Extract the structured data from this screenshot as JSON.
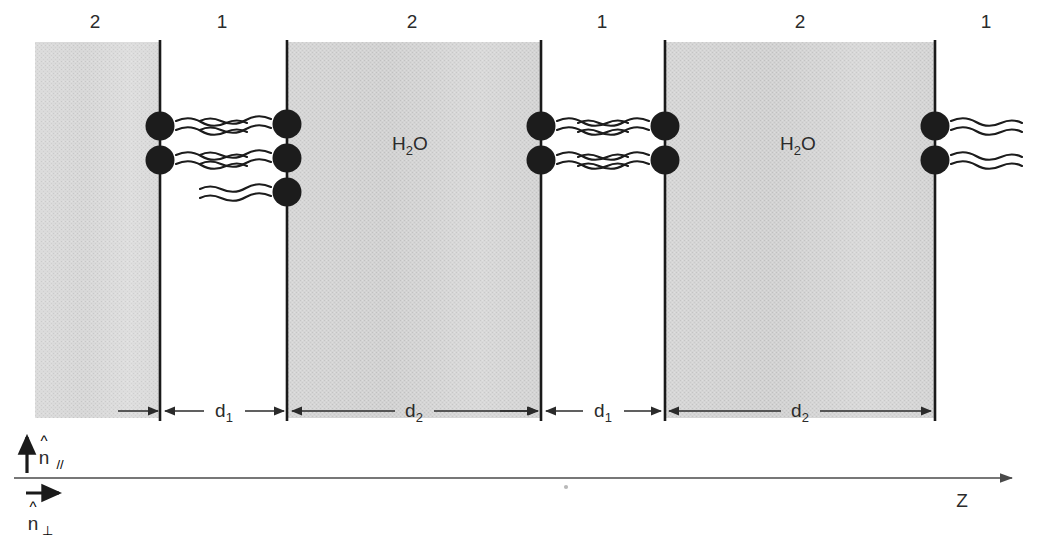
{
  "figure": {
    "background_color": "#ffffff",
    "ink_color": "#1c1c1c",
    "slab_fill_color": "#cfcfcf",
    "slab_fill_color_light": "#d6d6d6"
  },
  "top_labels": [
    {
      "text": "2",
      "x": 95
    },
    {
      "text": "1",
      "x": 222
    },
    {
      "text": "2",
      "x": 412
    },
    {
      "text": "1",
      "x": 602
    },
    {
      "text": "2",
      "x": 800
    },
    {
      "text": "1",
      "x": 986
    }
  ],
  "phase_labels": [
    {
      "text_main": "H",
      "text_sub": "2",
      "text_tail": "O",
      "x": 395,
      "y": 145
    },
    {
      "text_main": "H",
      "text_sub": "2",
      "text_tail": "O",
      "x": 783,
      "y": 145
    }
  ],
  "slabs": [
    {
      "name": "slab-medium-2-left-edge",
      "x": 35,
      "width": 126,
      "shade": "light"
    },
    {
      "name": "slab-medium-2-water-first",
      "x": 288,
      "width": 253,
      "shade": "normal"
    },
    {
      "name": "slab-medium-2-water-second",
      "x": 665,
      "width": 271,
      "shade": "normal"
    }
  ],
  "membrane_lines": [
    {
      "name": "membrane-interface-1",
      "x": 160
    },
    {
      "name": "membrane-interface-2",
      "x": 287
    },
    {
      "name": "membrane-interface-3",
      "x": 541
    },
    {
      "name": "membrane-interface-4",
      "x": 665
    },
    {
      "name": "membrane-interface-5",
      "x": 935
    }
  ],
  "lipids": [
    {
      "interface": 1,
      "x": 160,
      "y": 126,
      "tail_direction": "right"
    },
    {
      "interface": 1,
      "x": 160,
      "y": 160,
      "tail_direction": "right"
    },
    {
      "interface": 2,
      "x": 287,
      "y": 124,
      "tail_direction": "left"
    },
    {
      "interface": 2,
      "x": 287,
      "y": 158,
      "tail_direction": "left"
    },
    {
      "interface": 2,
      "x": 287,
      "y": 192,
      "tail_direction": "left"
    },
    {
      "interface": 3,
      "x": 541,
      "y": 126,
      "tail_direction": "right"
    },
    {
      "interface": 3,
      "x": 541,
      "y": 160,
      "tail_direction": "right"
    },
    {
      "interface": 4,
      "x": 665,
      "y": 126,
      "tail_direction": "left"
    },
    {
      "interface": 4,
      "x": 665,
      "y": 160,
      "tail_direction": "left"
    },
    {
      "interface": 5,
      "x": 935,
      "y": 126,
      "tail_direction": "right"
    },
    {
      "interface": 5,
      "x": 935,
      "y": 160,
      "tail_direction": "right"
    }
  ],
  "dimensions": [
    {
      "label_main": "d",
      "label_sub": "1",
      "x_start": 161,
      "x_end": 287,
      "label_x": 224,
      "y": 411
    },
    {
      "label_main": "d",
      "label_sub": "2",
      "x_start": 288,
      "x_end": 540,
      "label_x": 414,
      "y": 411
    },
    {
      "label_main": "d",
      "label_sub": "1",
      "x_start": 542,
      "x_end": 664,
      "label_x": 603,
      "y": 411
    },
    {
      "label_main": "d",
      "label_sub": "2",
      "x_start": 666,
      "x_end": 934,
      "label_x": 800,
      "y": 411
    }
  ],
  "axes": {
    "z_axis": {
      "label": "Z",
      "label_x": 962,
      "label_y": 500,
      "y": 478,
      "x_start": 14,
      "x_end": 1010
    },
    "normal_parallel": {
      "label_main": "n",
      "hat": "^",
      "subscript": "//",
      "arrow_x": 27,
      "arrow_y_top": 436,
      "arrow_y_bottom": 472,
      "label_x": 38,
      "label_y": 460
    },
    "normal_perpendicular": {
      "label_main": "n",
      "hat": "^",
      "subscript": "⊥",
      "arrow_y": 493,
      "arrow_x_start": 26,
      "arrow_x_end": 60,
      "label_x": 26,
      "label_y": 527
    }
  },
  "specks": [
    {
      "x": 566,
      "y": 487
    }
  ]
}
